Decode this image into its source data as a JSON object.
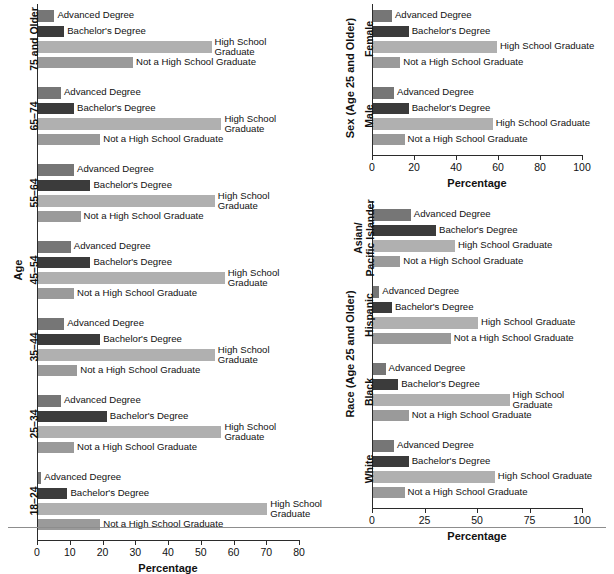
{
  "figure": {
    "background": "#ffffff",
    "series_colors": {
      "advanced_degree": "#767676",
      "bachelors_degree": "#3b3b3b",
      "high_school_graduate": "#b0b0b0",
      "not_a_high_school_graduate": "#9a9a9a"
    },
    "series_names": [
      "Advanced Degree",
      "Bachelor's Degree",
      "High School Graduate",
      "Not a High School Graduate"
    ],
    "xlabel": "Percentage"
  },
  "chart_data": [
    {
      "id": "age",
      "type": "bar",
      "orientation": "horizontal",
      "title": "",
      "xlabel": "Percentage",
      "ylabel": "Age",
      "xlim": [
        0,
        80
      ],
      "xticks": [
        0,
        10,
        20,
        30,
        40,
        50,
        60,
        70,
        80
      ],
      "xticklabels": [
        "0",
        "10",
        "20",
        "30",
        "40",
        "50",
        "60",
        "70",
        "80"
      ],
      "grid": false,
      "legend": "inline-bar-labels",
      "categories": [
        "75 and Older",
        "65–74",
        "55–64",
        "45–54",
        "35–44",
        "25–34",
        "18–24"
      ],
      "series": [
        {
          "name": "Advanced Degree",
          "values": [
            5,
            7,
            11,
            10,
            8,
            7,
            1
          ]
        },
        {
          "name": "Bachelor's Degree",
          "values": [
            8,
            11,
            16,
            16,
            19,
            21,
            9
          ]
        },
        {
          "name": "High School Graduate",
          "values": [
            53,
            56,
            54,
            57,
            54,
            56,
            70
          ]
        },
        {
          "name": "Not a High School Graduate",
          "values": [
            29,
            19,
            13,
            11,
            12,
            11,
            19
          ]
        }
      ]
    },
    {
      "id": "sex",
      "type": "bar",
      "orientation": "horizontal",
      "title": "",
      "xlabel": "Percentage",
      "ylabel": "Sex (Age 25 and Older)",
      "xlim": [
        0,
        100
      ],
      "xticks": [
        0,
        20,
        40,
        60,
        80,
        100
      ],
      "xticklabels": [
        "0",
        "20",
        "40",
        "60",
        "80",
        "100"
      ],
      "grid": false,
      "legend": "inline-bar-labels",
      "categories": [
        "Female",
        "Male"
      ],
      "series": [
        {
          "name": "Advanced Degree",
          "values": [
            9,
            10
          ]
        },
        {
          "name": "Bachelor's Degree",
          "values": [
            17,
            17
          ]
        },
        {
          "name": "High School Graduate",
          "values": [
            59,
            57
          ]
        },
        {
          "name": "Not a High School Graduate",
          "values": [
            13,
            15
          ]
        }
      ]
    },
    {
      "id": "race",
      "type": "bar",
      "orientation": "horizontal",
      "title": "",
      "xlabel": "Percentage",
      "ylabel": "Race (Age 25 and Older)",
      "xlim": [
        0,
        100
      ],
      "xticks": [
        0,
        25,
        50,
        75,
        100
      ],
      "xticklabels": [
        "0",
        "25",
        "50",
        "75",
        "100"
      ],
      "grid": false,
      "legend": "inline-bar-labels",
      "categories": [
        "Asian/Pacific Islander",
        "Hispanic",
        "Black",
        "White"
      ],
      "series": [
        {
          "name": "Advanced Degree",
          "values": [
            18,
            3,
            6,
            10
          ]
        },
        {
          "name": "Bachelor's Degree",
          "values": [
            30,
            9,
            12,
            17
          ]
        },
        {
          "name": "High School Graduate",
          "values": [
            39,
            50,
            65,
            58
          ]
        },
        {
          "name": "Not a High School Graduate",
          "values": [
            13,
            37,
            17,
            15
          ]
        }
      ]
    }
  ],
  "age_panel": {
    "axis_title": "Age",
    "x_title": "Percentage",
    "groups": [
      {
        "label": "75 and Older",
        "label_lines": [
          "75 and Older"
        ]
      },
      {
        "label": "65–74",
        "label_lines": [
          "65–74"
        ]
      },
      {
        "label": "55–64",
        "label_lines": [
          "55–64"
        ]
      },
      {
        "label": "45–54",
        "label_lines": [
          "45–54"
        ]
      },
      {
        "label": "35–44",
        "label_lines": [
          "35–44"
        ]
      },
      {
        "label": "25–34",
        "label_lines": [
          "25–34"
        ]
      },
      {
        "label": "18–24",
        "label_lines": [
          "18–24"
        ]
      }
    ]
  },
  "sex_panel": {
    "axis_title": "Sex (Age 25 and Older)",
    "x_title": "Percentage",
    "groups": [
      {
        "label": "Female"
      },
      {
        "label": "Male"
      }
    ]
  },
  "race_panel": {
    "axis_title": "Race (Age 25 and Older)",
    "x_title": "Percentage",
    "groups": [
      {
        "label": "Asian/Pacific Islander"
      },
      {
        "label": "Hispanic"
      },
      {
        "label": "Black"
      },
      {
        "label": "White"
      }
    ]
  }
}
